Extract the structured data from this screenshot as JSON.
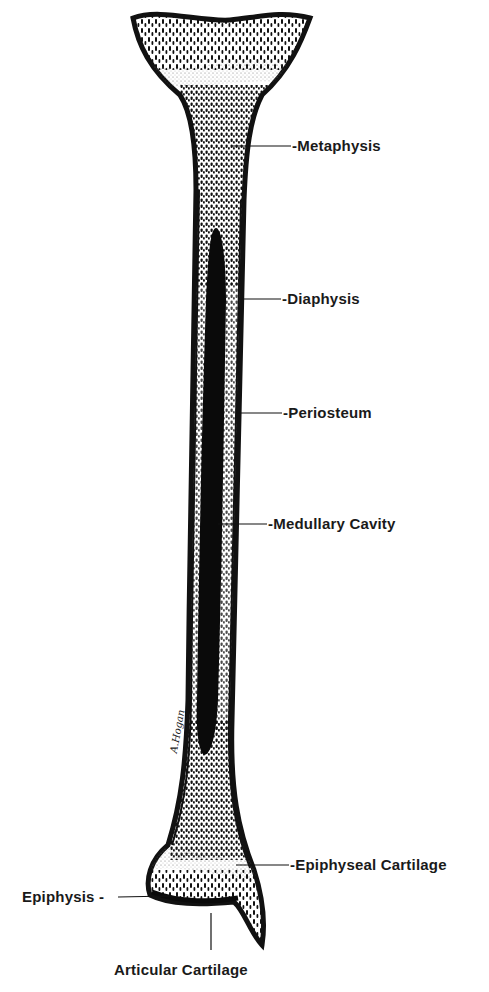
{
  "diagram": {
    "colors": {
      "ink": "#111111",
      "paper": "#ffffff",
      "cavity": "#0a0a0a",
      "cartilage_stipple": "#bdbdbd"
    },
    "labels": [
      {
        "id": "metaphysis",
        "text": "Metaphysis",
        "prefix": "-"
      },
      {
        "id": "diaphysis",
        "text": "Diaphysis",
        "prefix": "-"
      },
      {
        "id": "periosteum",
        "text": "Periosteum",
        "prefix": "-"
      },
      {
        "id": "medullary-cavity",
        "text": "Medullary Cavity",
        "prefix": "-"
      },
      {
        "id": "epiphyseal-cartilage",
        "text": "Epiphyseal Cartilage",
        "prefix": "-"
      },
      {
        "id": "epiphysis",
        "text": "Epiphysis",
        "suffix": " -"
      },
      {
        "id": "articular-cartilage",
        "text": "Articular Cartilage"
      }
    ],
    "signature": "A.Hogan"
  },
  "text": {
    "metaphysis": "-Metaphysis",
    "diaphysis": "-Diaphysis",
    "periosteum": "-Periosteum",
    "medullary_cavity": "-Medullary Cavity",
    "epiphyseal_cartilage": "-Epiphyseal Cartilage",
    "epiphysis": "Epiphysis -",
    "articular_cartilage": "Articular Cartilage",
    "signature": "A.Hogan"
  }
}
